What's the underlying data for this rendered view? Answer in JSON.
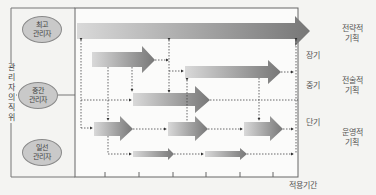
{
  "diagram": {
    "y_axis_label": "관리자의 직위",
    "x_axis_label": "적용기간",
    "manager_levels": [
      {
        "id": "top",
        "label": "최고\n관리자"
      },
      {
        "id": "middle",
        "label": "중간\n관리자"
      },
      {
        "id": "first_line",
        "label": "일선\n관리자"
      }
    ],
    "time_horizons": [
      {
        "id": "long",
        "label": "장기"
      },
      {
        "id": "medium",
        "label": "중기"
      },
      {
        "id": "short",
        "label": "단기"
      }
    ],
    "planning_types": [
      {
        "id": "strategic",
        "label": "전략적\n기획"
      },
      {
        "id": "tactical",
        "label": "전술적\n기획"
      },
      {
        "id": "operational",
        "label": "운영적\n기획"
      }
    ],
    "colors": {
      "arrow_light": "#d8d8d8",
      "arrow_dark": "#7a7a7a",
      "frame": "#666666",
      "oval_fill": "#c9c9c9"
    }
  }
}
